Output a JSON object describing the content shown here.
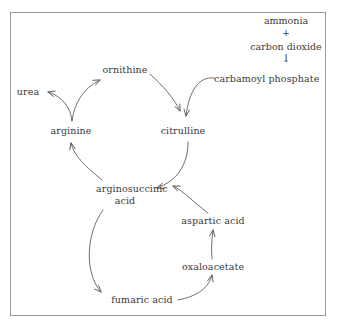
{
  "diagram": {
    "frame_color": "#9a9a9a",
    "text_color": "#3a3a3a",
    "background": "#ffffff",
    "inputs": {
      "reactant_1": "ammonia",
      "operator": "+",
      "reactant_2": "carbon dioxide",
      "arrow_glyph": "↓",
      "product": "carbamoyl phosphate"
    },
    "nodes": [
      {
        "id": "urea",
        "label": "urea"
      },
      {
        "id": "ornithine",
        "label": "ornithine"
      },
      {
        "id": "carbamoyl-phosphate",
        "label": "carbamoyl phosphate"
      },
      {
        "id": "arginine",
        "label": "arginine"
      },
      {
        "id": "citrulline",
        "label": "citrulline"
      },
      {
        "id": "arginosuccinic-acid",
        "label_line_1": "arginosuccinic",
        "label_line_2": "acid"
      },
      {
        "id": "aspartic-acid",
        "label": "aspartic acid"
      },
      {
        "id": "oxaloacetate",
        "label": "oxaloacetate"
      },
      {
        "id": "fumaric-acid",
        "label": "fumaric acid"
      }
    ],
    "edges": [
      {
        "from": "arginine",
        "to": "urea"
      },
      {
        "from": "arginine",
        "to": "ornithine"
      },
      {
        "from": "ornithine",
        "to": "citrulline"
      },
      {
        "from": "carbamoyl-phosphate",
        "to": "citrulline"
      },
      {
        "from": "citrulline",
        "to": "arginosuccinic-acid"
      },
      {
        "from": "aspartic-acid",
        "to": "arginosuccinic-acid"
      },
      {
        "from": "arginosuccinic-acid",
        "to": "arginine"
      },
      {
        "from": "arginosuccinic-acid",
        "to": "fumaric-acid"
      },
      {
        "from": "fumaric-acid",
        "to": "oxaloacetate"
      },
      {
        "from": "oxaloacetate",
        "to": "aspartic-acid"
      }
    ]
  }
}
